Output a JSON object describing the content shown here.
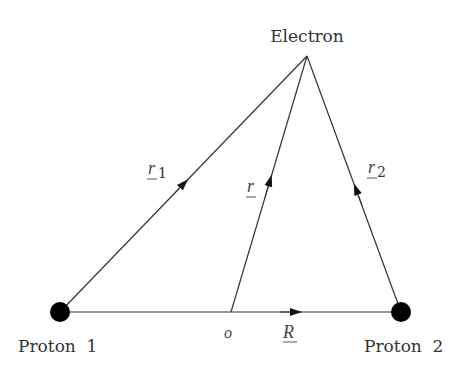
{
  "diagram": {
    "labels": {
      "electron": "Electron",
      "proton1": "Proton  1",
      "proton2": "Proton  2",
      "origin": "o"
    },
    "vectors": {
      "r1": {
        "symbol": "r",
        "subscript": "1"
      },
      "r": {
        "symbol": "r",
        "subscript": ""
      },
      "r2": {
        "symbol": "r",
        "subscript": "2"
      },
      "R": {
        "symbol": "R",
        "subscript": ""
      }
    },
    "colors": {
      "line": "#222222",
      "proton": "#000000",
      "text": "#333333"
    }
  }
}
